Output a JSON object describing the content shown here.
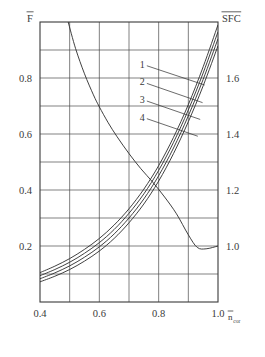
{
  "chart_data": {
    "type": "line",
    "title": "",
    "xlabel": "n_cor",
    "xlabel_display": "n",
    "xlabel_sub": "cor",
    "ylabel_left": "F",
    "ylabel_right": "SFC",
    "xlim": [
      0.4,
      1.0
    ],
    "ylim_left": [
      0.0,
      1.0
    ],
    "ylim_right": [
      0.8,
      1.8
    ],
    "grid": true,
    "legend_position": "inside-upper-right",
    "x_ticks": [
      0.4,
      0.5,
      0.6,
      0.7,
      0.8,
      0.9,
      1.0
    ],
    "x_tick_labels": [
      "0.4",
      "",
      "0.6",
      "",
      "0.8",
      "",
      "1.0"
    ],
    "y_left_ticks": [
      0.1,
      0.2,
      0.3,
      0.4,
      0.5,
      0.6,
      0.7,
      0.8,
      0.9,
      1.0
    ],
    "y_left_tick_labels": [
      "",
      "0.2",
      "",
      "0.4",
      "",
      "0.6",
      "",
      "0.8",
      "",
      ""
    ],
    "y_right_ticks": [
      0.8,
      0.9,
      1.0,
      1.1,
      1.2,
      1.3,
      1.4,
      1.5,
      1.6,
      1.7,
      1.8
    ],
    "y_right_tick_labels": [
      "",
      "",
      "1.0",
      "",
      "1.2",
      "",
      "1.4",
      "",
      "1.6",
      "",
      ""
    ],
    "series": [
      {
        "name": "1",
        "label": "1",
        "axis": "left",
        "x": [
          0.4,
          0.45,
          0.5,
          0.55,
          0.6,
          0.65,
          0.7,
          0.75,
          0.8,
          0.85,
          0.9,
          0.95,
          1.0
        ],
        "values": [
          0.105,
          0.128,
          0.155,
          0.188,
          0.227,
          0.275,
          0.333,
          0.403,
          0.487,
          0.588,
          0.705,
          0.84,
          0.99
        ]
      },
      {
        "name": "2",
        "label": "2",
        "axis": "left",
        "x": [
          0.4,
          0.45,
          0.5,
          0.55,
          0.6,
          0.65,
          0.7,
          0.75,
          0.8,
          0.85,
          0.9,
          0.95,
          1.0
        ],
        "values": [
          0.094,
          0.116,
          0.142,
          0.174,
          0.212,
          0.259,
          0.317,
          0.386,
          0.47,
          0.57,
          0.686,
          0.818,
          0.965
        ]
      },
      {
        "name": "3",
        "label": "3",
        "axis": "left",
        "x": [
          0.4,
          0.45,
          0.5,
          0.55,
          0.6,
          0.65,
          0.7,
          0.75,
          0.8,
          0.85,
          0.9,
          0.95,
          1.0
        ],
        "values": [
          0.083,
          0.104,
          0.129,
          0.16,
          0.197,
          0.243,
          0.3,
          0.368,
          0.451,
          0.55,
          0.665,
          0.795,
          0.94
        ]
      },
      {
        "name": "4",
        "label": "4",
        "axis": "left",
        "x": [
          0.4,
          0.45,
          0.5,
          0.55,
          0.6,
          0.65,
          0.7,
          0.75,
          0.8,
          0.85,
          0.9,
          0.95,
          1.0
        ],
        "values": [
          0.072,
          0.092,
          0.116,
          0.146,
          0.182,
          0.227,
          0.283,
          0.35,
          0.432,
          0.53,
          0.644,
          0.772,
          0.915
        ]
      },
      {
        "name": "SFC",
        "label": "",
        "axis": "right",
        "x": [
          0.495,
          0.52,
          0.55,
          0.58,
          0.6,
          0.63,
          0.66,
          0.7,
          0.74,
          0.78,
          0.82,
          0.86,
          0.9,
          0.93,
          0.96,
          1.0
        ],
        "values": [
          1.8,
          1.705,
          1.615,
          1.54,
          1.497,
          1.44,
          1.39,
          1.33,
          1.276,
          1.228,
          1.175,
          1.115,
          1.04,
          0.995,
          0.99,
          1.0
        ]
      }
    ],
    "annotations": [
      {
        "text": "1",
        "x_label": 0.745,
        "y_label": 1.648,
        "points_to_x": 0.955,
        "points_to_y": 1.575
      },
      {
        "text": "2",
        "x_label": 0.745,
        "y_label": 1.585,
        "points_to_x": 0.948,
        "points_to_y": 1.512
      },
      {
        "text": "3",
        "x_label": 0.745,
        "y_label": 1.522,
        "points_to_x": 0.94,
        "points_to_y": 1.452
      },
      {
        "text": "4",
        "x_label": 0.745,
        "y_label": 1.459,
        "points_to_x": 0.932,
        "points_to_y": 1.392
      }
    ]
  },
  "axes": {
    "left_title": "F",
    "right_title": "SFC",
    "bottom_title": "n",
    "bottom_title_sub": "cor"
  },
  "colors": {
    "background": "#ffffff",
    "grid": "#4a4a4a",
    "frame": "#3a3a3a",
    "curve": "#2b2b2b",
    "text": "#3a3a3a"
  }
}
